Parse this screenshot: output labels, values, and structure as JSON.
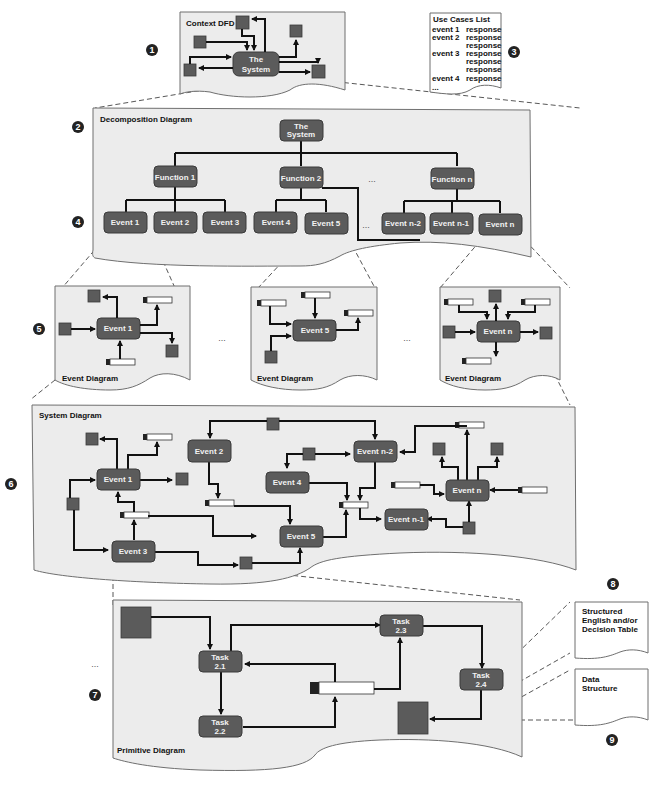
{
  "context": {
    "title": "Context DFD",
    "process": [
      "The",
      "System"
    ]
  },
  "use_cases": {
    "title": "Use Cases List",
    "rows": [
      {
        "event": "event 1",
        "response": "response"
      },
      {
        "event": "event 2",
        "response": "response"
      },
      {
        "event": "",
        "response": "response"
      },
      {
        "event": "event 3",
        "response": "response"
      },
      {
        "event": "",
        "response": "response"
      },
      {
        "event": "",
        "response": "response"
      },
      {
        "event": "event 4",
        "response": "response"
      }
    ],
    "more": "..."
  },
  "decomposition": {
    "title": "Decomposition Diagram",
    "root": [
      "The",
      "System"
    ],
    "functions": [
      "Function 1",
      "Function 2",
      "Function n"
    ],
    "events": [
      "Event 1",
      "Event 2",
      "Event 3",
      "Event 4",
      "Event 5",
      "Event n-2",
      "Event n-1",
      "Event n"
    ],
    "ellipsis": "..."
  },
  "event_diagrams": {
    "title": "Event Diagram",
    "items": [
      "Event 1",
      "Event 5",
      "Event n"
    ],
    "ellipsis": "..."
  },
  "system_diagram": {
    "title": "System Diagram",
    "events": {
      "e1": "Event 1",
      "e2": "Event 2",
      "e3": "Event 3",
      "e4": "Event 4",
      "e5": "Event 5",
      "en2": "Event n-2",
      "en1": "Event n-1",
      "en": "Event n"
    }
  },
  "primitive_diagram": {
    "title": "Primitive Diagram",
    "tasks": {
      "t21": [
        "Task",
        "2.1"
      ],
      "t22": [
        "Task",
        "2.2"
      ],
      "t23": [
        "Task",
        "2.3"
      ],
      "t24": [
        "Task",
        "2.4"
      ]
    },
    "ellipsis": "..."
  },
  "structured_english": {
    "lines": [
      "Structured",
      "English and/or",
      "Decision Table"
    ]
  },
  "data_structure": {
    "lines": [
      "Data",
      "Structure"
    ]
  },
  "markers": [
    "1",
    "2",
    "3",
    "4",
    "5",
    "6",
    "7",
    "8",
    "9"
  ],
  "colors": {
    "panel": "#ececec",
    "process": "#5b5b5b",
    "line": "#111111"
  }
}
